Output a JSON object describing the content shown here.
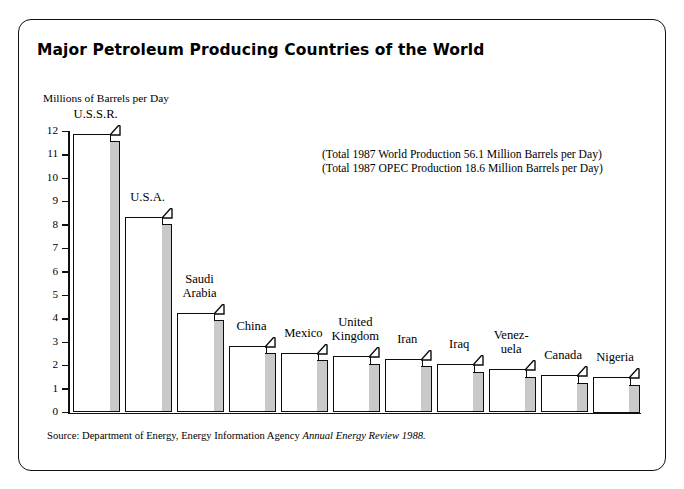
{
  "page_header_partial": "Petroleum and Petrochemical Industry",
  "figure": {
    "title": "Major Petroleum Producing Countries of the World",
    "axis_unit_label": "Millions of Barrels per Day",
    "annotations": [
      "(Total 1987 World Production 56.1 Million Barrels per Day)",
      "(Total 1987 OPEC Production 18.6 Million Barrels per Day)"
    ],
    "source_prefix": "Source: Department of Energy, Energy Information Agency ",
    "source_italic": "Annual Energy Review 1988."
  },
  "chart_data": {
    "type": "bar",
    "title": "Major Petroleum Producing Countries of the World",
    "xlabel": "",
    "ylabel": "Millions of Barrels per Day",
    "ylim": [
      0,
      12
    ],
    "y_ticks": [
      "0",
      "1",
      "2",
      "3",
      "4",
      "5",
      "6",
      "7",
      "8",
      "9",
      "10",
      "11",
      "12"
    ],
    "grid": false,
    "legend": "none",
    "style": "3d-shaded-bars",
    "bar_fill_color": "#ffffff",
    "bar_side_color": "#c9c9c9",
    "bar_outline_color": "#0d0d0d",
    "categories": [
      "U.S.S.R.",
      "U.S.A.",
      "Saudi\nArabia",
      "China",
      "Mexico",
      "United\nKingdom",
      "Iran",
      "Iraq",
      "Venez-\nuela",
      "Canada",
      "Nigeria"
    ],
    "values": [
      11.9,
      8.35,
      4.25,
      2.85,
      2.55,
      2.4,
      2.3,
      2.05,
      1.85,
      1.6,
      1.5
    ],
    "annotations": [
      "(Total 1987 World Production 56.1 Million Barrels per Day)",
      "(Total 1987 OPEC Production 18.6 Million Barrels per Day)"
    ]
  }
}
